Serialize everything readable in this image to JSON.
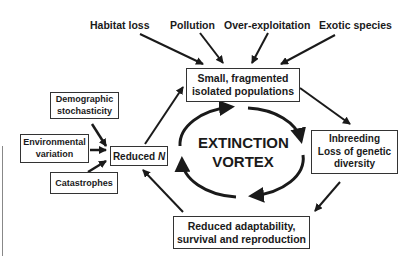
{
  "diagram": {
    "title": "Extinction vortex",
    "threats": [
      "Habitat loss",
      "Pollution",
      "Over-exploitation",
      "Exotic species"
    ],
    "stochastic_factors": {
      "demographic": [
        "Demographic",
        "stochasticity"
      ],
      "environmental": [
        "Environmental",
        "variation"
      ],
      "catastrophes": "Catastrophes"
    },
    "nodes": {
      "small_populations": [
        "Small, fragmented",
        "isolated populations"
      ],
      "inbreeding": [
        "Inbreeding",
        "Loss of genetic",
        "diversity"
      ],
      "reduced_adaptability": [
        "Reduced adaptability,",
        "survival and reproduction"
      ],
      "reduced_n_prefix": "Reduced ",
      "reduced_n_var": "N"
    },
    "center": [
      "EXTINCTION",
      "VORTEX"
    ],
    "colors": {
      "line": "#1a1a1a",
      "box_border": "#333333",
      "background": "#ffffff"
    }
  }
}
